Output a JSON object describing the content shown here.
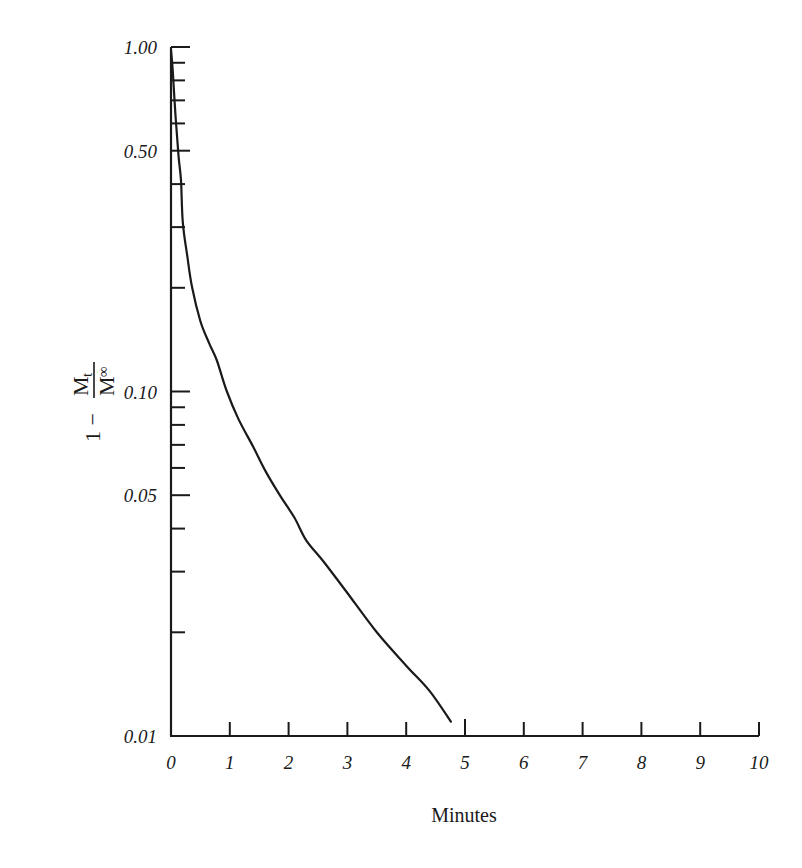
{
  "chart_data": {
    "type": "line",
    "title": "",
    "xlabel": "Minutes",
    "ylabel": "1 − Mt / M∞",
    "ylabel_parts": {
      "one": "1",
      "minus": "−",
      "num": "M",
      "num_sub": "t",
      "den": "M",
      "den_sub": "∞"
    },
    "xscale": "linear",
    "yscale": "log",
    "xlim": [
      0,
      10
    ],
    "ylim": [
      0.01,
      1.0
    ],
    "grid": false,
    "legend": null,
    "x_ticks": [
      0,
      1,
      2,
      3,
      4,
      5,
      6,
      7,
      8,
      9,
      10
    ],
    "x_tick_labels": [
      "0",
      "1",
      "2",
      "3",
      "4",
      "5",
      "6",
      "7",
      "8",
      "9",
      "10"
    ],
    "y_major_ticks": [
      1.0,
      0.5,
      0.1,
      0.05,
      0.01
    ],
    "y_tick_labels": [
      "1.00",
      "0.50",
      "0.10",
      "0.05",
      "0.01"
    ],
    "y_minor_ticks": [
      0.9,
      0.8,
      0.7,
      0.6,
      0.4,
      0.3,
      0.2,
      0.09,
      0.08,
      0.07,
      0.06,
      0.04,
      0.03,
      0.02
    ],
    "series": [
      {
        "name": "1 - Mt/M∞",
        "color": "#1a1a1a",
        "x": [
          0.0,
          0.03,
          0.08,
          0.13,
          0.17,
          0.2,
          0.28,
          0.36,
          0.5,
          0.65,
          0.78,
          0.95,
          1.15,
          1.4,
          1.6,
          1.85,
          2.1,
          2.3,
          2.6,
          3.0,
          3.5,
          4.0,
          4.4,
          4.76
        ],
        "y": [
          0.98,
          0.85,
          0.62,
          0.48,
          0.41,
          0.31,
          0.245,
          0.2,
          0.16,
          0.138,
          0.123,
          0.1,
          0.083,
          0.069,
          0.059,
          0.05,
          0.043,
          0.037,
          0.032,
          0.026,
          0.02,
          0.016,
          0.0135,
          0.011
        ]
      }
    ]
  },
  "labels": {
    "x_axis_title": "Minutes",
    "y_axis_one": "1 −",
    "y_axis_num": "M",
    "y_axis_num_sub": "t",
    "y_axis_den": "M",
    "y_axis_den_sub": "∞"
  },
  "colors": {
    "ink": "#1a1a1a",
    "background": "#ffffff"
  }
}
